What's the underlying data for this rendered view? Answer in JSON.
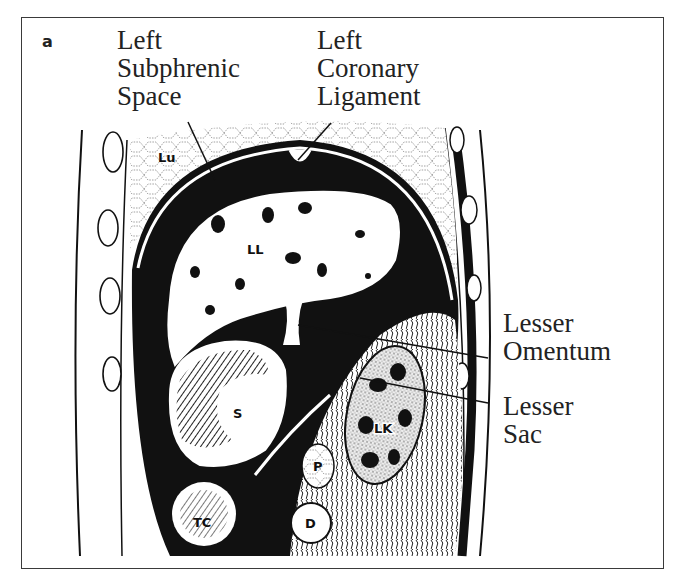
{
  "figure": {
    "panel_label": "a",
    "callouts": {
      "left_subphrenic_space": "Left\nSubphrenic\nSpace",
      "left_coronary_ligament": "Left\nCoronary\nLigament",
      "lesser_omentum": "Lesser\nOmentum",
      "lesser_sac": "Lesser\nSac"
    },
    "organ_labels": {
      "lung": "Lu",
      "left_lobe_liver": "LL",
      "stomach": "S",
      "transverse_colon": "TC",
      "pancreas": "P",
      "duodenum": "D",
      "left_kidney": "LK"
    },
    "colors": {
      "ink": "#111111",
      "paper": "#ffffff",
      "frame": "#3a3a3a"
    }
  }
}
